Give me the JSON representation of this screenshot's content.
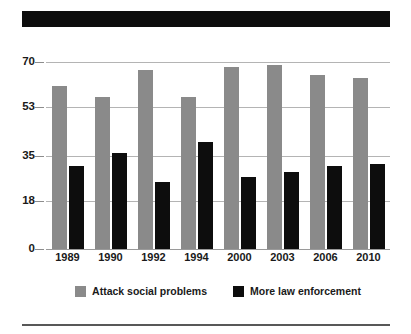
{
  "banner": {
    "name": "title-banner",
    "text": "",
    "color": "#0d0d0d"
  },
  "colors": {
    "series_a": "#8a8a8a",
    "series_b": "#0d0d0d",
    "gridline": "#b4b4b4",
    "text": "#1a1a1a",
    "background": "#ffffff"
  },
  "chart_data": {
    "type": "bar",
    "title": "",
    "xlabel": "",
    "ylabel": "",
    "ylim": [
      0,
      70
    ],
    "yticks": [
      0,
      18,
      35,
      53,
      70
    ],
    "ytick_labels": [
      "0",
      "18",
      "35",
      "53",
      "70"
    ],
    "grid": true,
    "legend_position": "bottom",
    "categories": [
      "1989",
      "1990",
      "1992",
      "1994",
      "2000",
      "2003",
      "2006",
      "2010"
    ],
    "series": [
      {
        "name": "Attack social problems",
        "color": "#8a8a8a",
        "values": [
          61,
          57,
          67,
          57,
          68,
          69,
          65,
          64
        ]
      },
      {
        "name": "More law enforcement",
        "color": "#0d0d0d",
        "values": [
          31,
          36,
          25,
          40,
          27,
          29,
          31,
          32
        ]
      }
    ]
  }
}
